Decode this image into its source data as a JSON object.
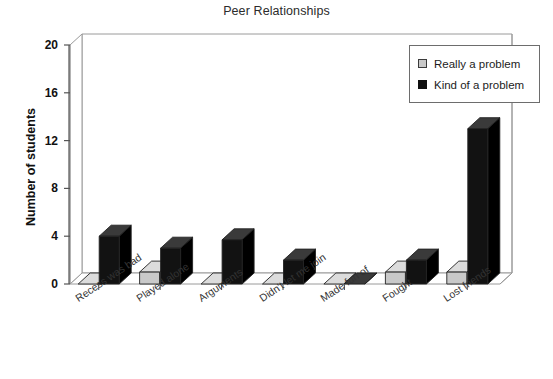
{
  "chart_data": {
    "type": "bar",
    "title": "Peer Relationships",
    "xlabel": "",
    "ylabel": "Number of students",
    "ylim": [
      0,
      20
    ],
    "yticks": [
      0,
      4,
      8,
      12,
      16,
      20
    ],
    "grid": false,
    "legend_position": "top-right",
    "style": "3d-clustered-column",
    "categories": [
      "Recess was bad",
      "Played alone",
      "Arguments",
      "Didn't let me join",
      "Made fun of",
      "Fought",
      "Lost friends"
    ],
    "series": [
      {
        "name": "Really a problem",
        "color": "#c9c9c9",
        "values": [
          0,
          1,
          0,
          0,
          0,
          1,
          1
        ]
      },
      {
        "name": "Kind of a problem",
        "color": "#101010",
        "values": [
          4,
          3,
          3.7,
          2,
          0,
          2,
          13
        ]
      }
    ]
  },
  "legend": {
    "items": [
      {
        "label": "Really a problem",
        "swatch": "really-a-problem-swatch"
      },
      {
        "label": "Kind of a problem",
        "swatch": "kind-of-a-problem-swatch"
      }
    ]
  }
}
